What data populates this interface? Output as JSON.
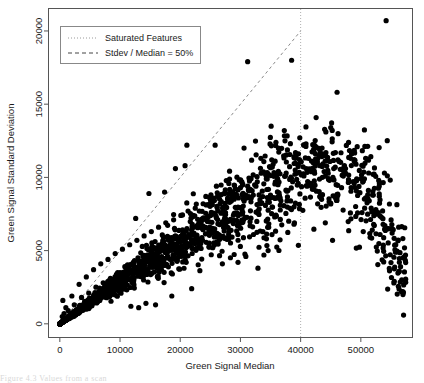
{
  "figure": {
    "background_color": "#ffffff",
    "point_color": "#000000",
    "frame_color": "#555555",
    "caption_partial": "Figure 4.3 Values from a scan"
  },
  "chart_data": {
    "type": "scatter",
    "title": "",
    "xlabel": "Green Signal Median",
    "ylabel": "Green Signal Standard Deviation",
    "xlim": [
      -1800,
      58500
    ],
    "ylim": [
      -900,
      21500
    ],
    "xticks": [
      0,
      10000,
      20000,
      30000,
      40000,
      50000
    ],
    "xtick_labels": [
      "0",
      "10000",
      "20000",
      "30000",
      "40000",
      "50000"
    ],
    "yticks": [
      0,
      5000,
      10000,
      15000,
      20000
    ],
    "ytick_labels": [
      "0",
      "5000",
      "10000",
      "15000",
      "20000"
    ],
    "grid": false,
    "legend_position": "top-left",
    "legend": [
      {
        "label": "Saturated Features",
        "style": "dotted",
        "color": "#888888"
      },
      {
        "label": "Stdev / Median = 50%",
        "style": "dashed",
        "color": "#555555"
      }
    ],
    "annotations": [
      {
        "kind": "vline",
        "name": "saturated-features-line",
        "x": 40000,
        "style": "dotted",
        "label": "Saturated Features"
      },
      {
        "kind": "line",
        "name": "stdev-median-50-line",
        "x0": 0,
        "y0": 0,
        "x1": 40000,
        "y1": 20000,
        "slope": 0.5,
        "style": "dashed",
        "label": "Stdev / Median = 50%"
      }
    ],
    "point_count_approx": 1900,
    "series": [
      {
        "name": "Features",
        "marker": "filled-circle",
        "marker_size_px": 2.6,
        "points": [
          [
            54200,
            20700
          ],
          [
            31200,
            17900
          ],
          [
            38500,
            18000
          ],
          [
            35100,
            13500
          ],
          [
            45000,
            13400
          ],
          [
            21100,
            12200
          ],
          [
            25800,
            12200
          ],
          [
            30600,
            12000
          ],
          [
            35900,
            12400
          ],
          [
            37400,
            12500
          ],
          [
            38300,
            12300
          ],
          [
            36300,
            12000
          ],
          [
            40600,
            12200
          ],
          [
            42900,
            12000
          ],
          [
            44200,
            11700
          ],
          [
            43100,
            11500
          ],
          [
            19200,
            10600
          ],
          [
            20800,
            10800
          ],
          [
            33400,
            11300
          ],
          [
            35200,
            11200
          ],
          [
            41300,
            11300
          ],
          [
            42100,
            11000
          ],
          [
            46200,
            11200
          ],
          [
            48300,
            11300
          ],
          [
            47000,
            10500
          ],
          [
            45500,
            10600
          ],
          [
            43900,
            10400
          ],
          [
            40900,
            10600
          ],
          [
            39100,
            10500
          ],
          [
            37600,
            10300
          ],
          [
            36000,
            10100
          ],
          [
            34300,
            9900
          ],
          [
            32800,
            9700
          ],
          [
            31200,
            9400
          ],
          [
            30000,
            9300
          ],
          [
            28600,
            9000
          ],
          [
            27400,
            8900
          ],
          [
            26200,
            8700
          ],
          [
            25000,
            8500
          ],
          [
            23800,
            8200
          ],
          [
            22500,
            7900
          ],
          [
            21300,
            7700
          ],
          [
            20100,
            7400
          ],
          [
            18900,
            7100
          ],
          [
            17600,
            6900
          ],
          [
            16400,
            6600
          ],
          [
            15200,
            6300
          ],
          [
            14000,
            6000
          ],
          [
            12800,
            5700
          ],
          [
            11600,
            5400
          ],
          [
            10400,
            5100
          ],
          [
            9200,
            4800
          ],
          [
            8000,
            4400
          ],
          [
            6800,
            4100
          ],
          [
            5600,
            3700
          ],
          [
            4400,
            3200
          ],
          [
            3200,
            2700
          ],
          [
            2000,
            1900
          ],
          [
            1000,
            1100
          ],
          [
            400,
            500
          ],
          [
            50600,
            9900
          ],
          [
            51400,
            8400
          ],
          [
            50200,
            7600
          ],
          [
            52500,
            7800
          ],
          [
            52900,
            7600
          ],
          [
            53700,
            6800
          ],
          [
            54600,
            6500
          ],
          [
            55200,
            6200
          ],
          [
            55800,
            5400
          ],
          [
            56400,
            4200
          ],
          [
            56600,
            3900
          ],
          [
            56800,
            3000
          ],
          [
            57000,
            2000
          ],
          [
            57100,
            600
          ],
          [
            50800,
            11300
          ],
          [
            49200,
            10900
          ],
          [
            48000,
            9700
          ],
          [
            46800,
            9300
          ],
          [
            45900,
            9500
          ],
          [
            44800,
            9800
          ],
          [
            12600,
            7200
          ],
          [
            14800,
            8900
          ],
          [
            17400,
            9000
          ],
          [
            16900,
            5400
          ],
          [
            15900,
            1300
          ],
          [
            13100,
            1100
          ],
          [
            11800,
            1200
          ],
          [
            14300,
            1400
          ],
          [
            18600,
            1900
          ],
          [
            21900,
            2400
          ],
          [
            500,
            1600
          ],
          [
            29600,
            4200
          ],
          [
            30900,
            4600
          ],
          [
            33900,
            4700
          ],
          [
            34600,
            5000
          ],
          [
            38900,
            6800
          ],
          [
            44100,
            6900
          ],
          [
            45300,
            5700
          ],
          [
            27000,
            4100
          ],
          [
            25400,
            5200
          ],
          [
            23100,
            5600
          ],
          [
            19800,
            4600
          ],
          [
            22800,
            6700
          ],
          [
            24600,
            7300
          ],
          [
            26800,
            7600
          ],
          [
            28200,
            8300
          ],
          [
            29400,
            7900
          ],
          [
            31800,
            8600
          ],
          [
            33100,
            8800
          ],
          [
            34800,
            8300
          ],
          [
            36600,
            8600
          ],
          [
            37900,
            9100
          ],
          [
            39600,
            9600
          ],
          [
            41800,
            9400
          ],
          [
            43400,
            8600
          ],
          [
            20400,
            6100
          ],
          [
            18200,
            5800
          ],
          [
            16100,
            5000
          ],
          [
            13800,
            4600
          ],
          [
            12200,
            4200
          ],
          [
            10800,
            3900
          ],
          [
            9600,
            3500
          ],
          [
            8400,
            3100
          ],
          [
            7200,
            2800
          ],
          [
            6000,
            2500
          ],
          [
            4800,
            2100
          ],
          [
            3600,
            1800
          ],
          [
            2400,
            1300
          ],
          [
            1400,
            900
          ],
          [
            700,
            700
          ],
          [
            53200,
            6100
          ],
          [
            54000,
            6700
          ],
          [
            51900,
            6400
          ],
          [
            50400,
            6300
          ]
        ]
      }
    ]
  }
}
